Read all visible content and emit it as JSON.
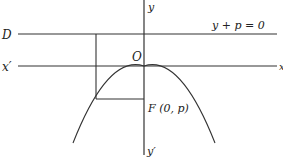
{
  "diagram": {
    "type": "parabola-focus-directrix",
    "colors": {
      "stroke": "#333333",
      "text": "#222222",
      "background": "#ffffff"
    },
    "labels": {
      "directrix_name": "D",
      "directrix_equation": "y + p = 0",
      "x_axis_neg": "x′",
      "x_axis_pos": "x",
      "y_axis_pos": "y",
      "y_axis_neg": "y′",
      "origin": "O",
      "focus": "F (0, p)"
    }
  }
}
